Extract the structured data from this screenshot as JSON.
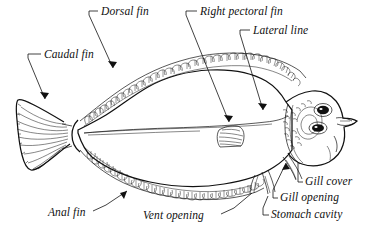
{
  "figure": {
    "style": "line drawing",
    "background_color": "#ffffff",
    "ink_color": "#111111",
    "width": 373,
    "height": 244
  },
  "labels": [
    {
      "id": "dorsal-fin",
      "text": "Dorsal fin",
      "x": 101,
      "y": 13,
      "anchor": "left"
    },
    {
      "id": "right-pectoral-fin",
      "text": "Right pectoral fin",
      "x": 200,
      "y": 13,
      "anchor": "left"
    },
    {
      "id": "lateral-line",
      "text": "Lateral line",
      "x": 253,
      "y": 32,
      "anchor": "left"
    },
    {
      "id": "caudal-fin",
      "text": "Caudal fin",
      "x": 44,
      "y": 56,
      "anchor": "left"
    },
    {
      "id": "gill-cover",
      "text": "Gill cover",
      "x": 305,
      "y": 182,
      "anchor": "left"
    },
    {
      "id": "gill-opening",
      "text": "Gill opening",
      "x": 280,
      "y": 198,
      "anchor": "left"
    },
    {
      "id": "stomach-cavity",
      "text": "Stomach cavity",
      "x": 271,
      "y": 215,
      "anchor": "left"
    },
    {
      "id": "anal-fin",
      "text": "Anal fin",
      "x": 48,
      "y": 213,
      "anchor": "left"
    },
    {
      "id": "vent-opening",
      "text": "Vent opening",
      "x": 143,
      "y": 216,
      "anchor": "left"
    }
  ],
  "parts": [
    {
      "id": "dorsal-fin",
      "name": "Dorsal fin"
    },
    {
      "id": "caudal-fin",
      "name": "Caudal fin"
    },
    {
      "id": "anal-fin",
      "name": "Anal fin"
    },
    {
      "id": "right-pectoral-fin",
      "name": "Right pectoral fin"
    },
    {
      "id": "lateral-line",
      "name": "Lateral line"
    },
    {
      "id": "gill-cover",
      "name": "Gill cover"
    },
    {
      "id": "gill-opening",
      "name": "Gill opening"
    },
    {
      "id": "stomach-cavity",
      "name": "Stomach cavity"
    },
    {
      "id": "vent-opening",
      "name": "Vent opening"
    },
    {
      "id": "eye-upper",
      "name": "Upper eye"
    },
    {
      "id": "eye-lower",
      "name": "Lower eye"
    }
  ]
}
